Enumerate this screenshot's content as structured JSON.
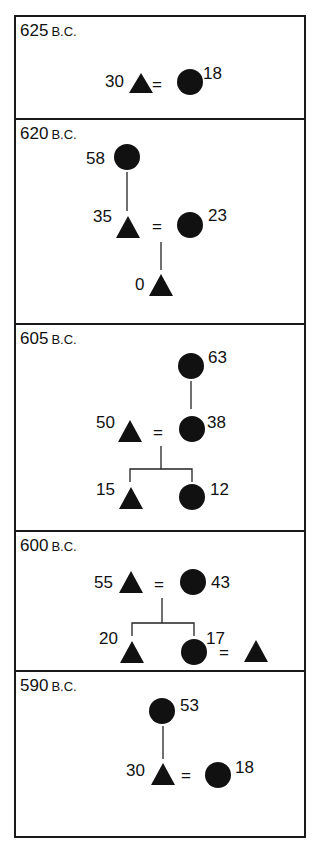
{
  "era_suffix": "B.C.",
  "panels": [
    {
      "year": "625",
      "nodes": [
        {
          "shape": "triangle",
          "age": "30"
        },
        {
          "shape": "circle",
          "age": "18"
        }
      ]
    },
    {
      "year": "620",
      "nodes": [
        {
          "shape": "circle",
          "age": "58"
        },
        {
          "shape": "triangle",
          "age": "35"
        },
        {
          "shape": "circle",
          "age": "23"
        },
        {
          "shape": "triangle",
          "age": "0"
        }
      ]
    },
    {
      "year": "605",
      "nodes": [
        {
          "shape": "circle",
          "age": "63"
        },
        {
          "shape": "triangle",
          "age": "50"
        },
        {
          "shape": "circle",
          "age": "38"
        },
        {
          "shape": "triangle",
          "age": "15"
        },
        {
          "shape": "circle",
          "age": "12"
        }
      ]
    },
    {
      "year": "600",
      "nodes": [
        {
          "shape": "triangle",
          "age": "55"
        },
        {
          "shape": "circle",
          "age": "43"
        },
        {
          "shape": "triangle",
          "age": "20"
        },
        {
          "shape": "circle",
          "age": "17"
        },
        {
          "shape": "triangle",
          "age": ""
        }
      ]
    },
    {
      "year": "590",
      "nodes": [
        {
          "shape": "circle",
          "age": "53"
        },
        {
          "shape": "triangle",
          "age": "30"
        },
        {
          "shape": "circle",
          "age": "18"
        }
      ]
    }
  ],
  "marriage_symbol": "="
}
